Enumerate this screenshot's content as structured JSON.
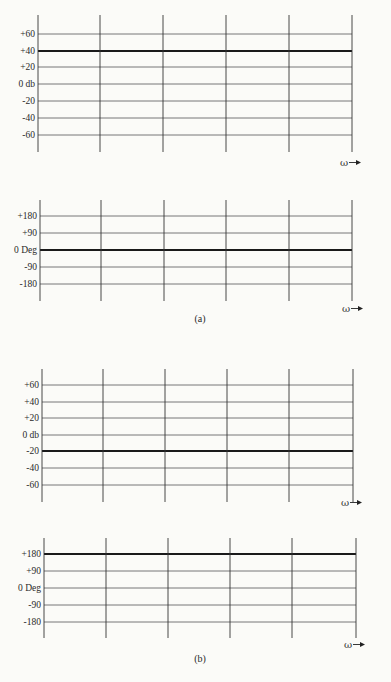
{
  "chart_data": [
    {
      "type": "line",
      "panel": "(a) magnitude",
      "ylabel": "db",
      "xlabel": "ω",
      "yticks": [
        "+60",
        "+40",
        "+20",
        "0 db",
        "-20",
        "-40",
        "-60"
      ],
      "ytick_values": [
        60,
        40,
        20,
        0,
        -20,
        -40,
        -60
      ],
      "ylim": [
        -70,
        70
      ],
      "grid": true,
      "series": [
        {
          "name": "magnitude",
          "constant_value": 40
        }
      ],
      "geom": {
        "vx": [
          38,
          100,
          163,
          226,
          289,
          352
        ],
        "top": 15,
        "bottom": 152,
        "hy": [
          34,
          51,
          67,
          84,
          101,
          118,
          135
        ],
        "bold_index": 1,
        "omega_x": 340,
        "omega_y": 166
      }
    },
    {
      "type": "line",
      "panel": "(a) phase",
      "ylabel": "Deg",
      "xlabel": "ω",
      "yticks": [
        "+180",
        "+90",
        "0 Deg",
        "-90",
        "-180"
      ],
      "ytick_values": [
        180,
        90,
        0,
        -90,
        -180
      ],
      "ylim": [
        -200,
        200
      ],
      "grid": true,
      "series": [
        {
          "name": "phase",
          "constant_value": 0
        }
      ],
      "geom": {
        "vx": [
          40,
          101,
          164,
          226,
          289,
          352
        ],
        "top": 200,
        "bottom": 301,
        "hy": [
          216,
          233,
          250,
          267,
          284
        ],
        "bold_index": 2,
        "omega_x": 342,
        "omega_y": 312
      }
    },
    {
      "type": "line",
      "panel": "(b) magnitude",
      "ylabel": "db",
      "xlabel": "ω",
      "yticks": [
        "+60",
        "+40",
        "+20",
        "0 db",
        "-20",
        "-40",
        "-60"
      ],
      "ytick_values": [
        60,
        40,
        20,
        0,
        -20,
        -40,
        -60
      ],
      "ylim": [
        -70,
        70
      ],
      "grid": true,
      "series": [
        {
          "name": "magnitude",
          "constant_value": -20
        }
      ],
      "geom": {
        "vx": [
          42,
          103,
          165,
          227,
          289,
          353
        ],
        "top": 369,
        "bottom": 502,
        "hy": [
          385,
          402,
          418,
          435,
          451,
          468,
          485
        ],
        "bold_index": 4,
        "omega_x": 341,
        "omega_y": 506
      }
    },
    {
      "type": "line",
      "panel": "(b) phase",
      "ylabel": "Deg",
      "xlabel": "ω",
      "yticks": [
        "+180",
        "+90",
        "0 Deg",
        "-90",
        "-180"
      ],
      "ytick_values": [
        180,
        90,
        0,
        -90,
        -180
      ],
      "ylim": [
        -200,
        200
      ],
      "grid": true,
      "series": [
        {
          "name": "phase",
          "constant_value": 180
        }
      ],
      "geom": {
        "vx": [
          44,
          106,
          168,
          230,
          292,
          356
        ],
        "top": 538,
        "bottom": 638,
        "hy": [
          554,
          571,
          588,
          605,
          622
        ],
        "bold_index": 0,
        "omega_x": 344,
        "omega_y": 648
      }
    }
  ],
  "captions": [
    {
      "text": "(a)",
      "x": 200,
      "y": 322
    },
    {
      "text": "(b)",
      "x": 200,
      "y": 662
    }
  ],
  "axis_symbol": "ω"
}
